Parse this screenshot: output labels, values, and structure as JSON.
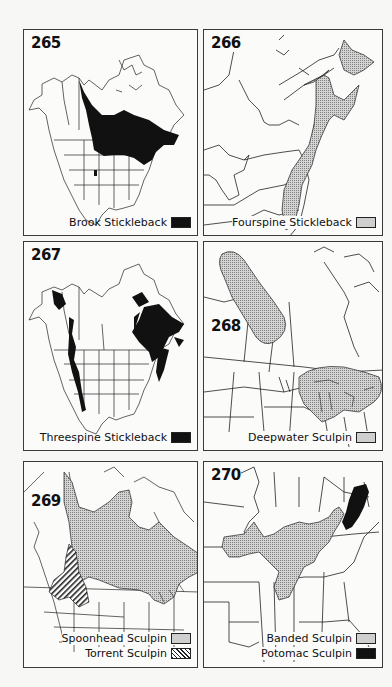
{
  "figure": {
    "panels": [
      {
        "number": "265",
        "region": "North America",
        "legend": [
          {
            "label": "Brook Stickleback",
            "pattern": "solid-black",
            "color": "#111111"
          }
        ]
      },
      {
        "number": "266",
        "region": "Northeastern North America",
        "legend": [
          {
            "label": "Fourspine Stickleback",
            "pattern": "stipple",
            "color": "#cfcfcf"
          }
        ]
      },
      {
        "number": "267",
        "region": "North America",
        "legend": [
          {
            "label": "Threespine Stickleback",
            "pattern": "solid-black",
            "color": "#111111"
          }
        ]
      },
      {
        "number": "268",
        "region": "Central Canada and Great Lakes",
        "legend": [
          {
            "label": "Deepwater Sculpin",
            "pattern": "stipple",
            "color": "#cfcfcf"
          }
        ]
      },
      {
        "number": "269",
        "region": "Canada and northern United States",
        "legend": [
          {
            "label": "Spoonhead Sculpin",
            "pattern": "stipple",
            "color": "#cfcfcf"
          },
          {
            "label": "Torrent Sculpin",
            "pattern": "diagonal-hatch",
            "color": "#222222"
          }
        ]
      },
      {
        "number": "270",
        "region": "Southeastern United States",
        "legend": [
          {
            "label": "Banded Sculpin",
            "pattern": "stipple",
            "color": "#cfcfcf"
          },
          {
            "label": "Potomac Sculpin",
            "pattern": "solid-black",
            "color": "#111111"
          }
        ]
      }
    ]
  }
}
